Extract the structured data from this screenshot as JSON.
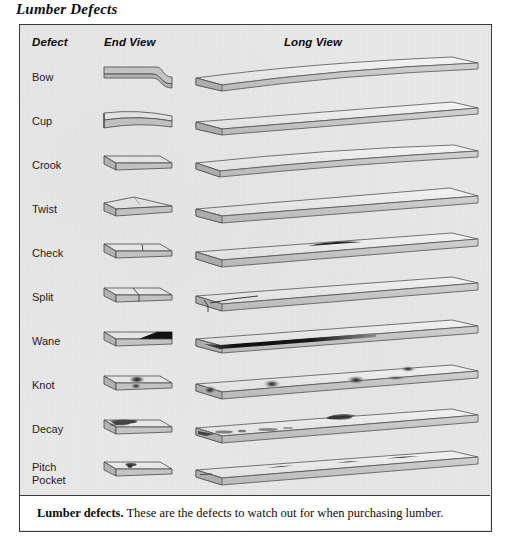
{
  "figure": {
    "title": "Lumber Defects",
    "caption_lead": "Lumber defects.",
    "caption_body": " These are the defects to watch out for when purchasing lumber."
  },
  "table": {
    "headers": {
      "defect": "Defect",
      "end_view": "End View",
      "long_view": "Long View"
    },
    "rows": [
      {
        "name": "Bow",
        "end_view_desc": "board end curving downward at one edge",
        "long_view_desc": "board bowed along its length, curving up at the far end"
      },
      {
        "name": "Cup",
        "end_view_desc": "board end with concave cupped face",
        "long_view_desc": "straight board with slightly cupped face"
      },
      {
        "name": "Crook",
        "end_view_desc": "flat straight board end",
        "long_view_desc": "board bent sideways edgewise along its length"
      },
      {
        "name": "Twist",
        "end_view_desc": "board end peaked and twisted",
        "long_view_desc": "board twisted, corners out of plane"
      },
      {
        "name": "Check",
        "end_view_desc": "short crack line in top face",
        "long_view_desc": "short lengthwise crack in the middle of the face"
      },
      {
        "name": "Split",
        "end_view_desc": "crack running full depth through the end",
        "long_view_desc": "crack running in from the end of the board"
      },
      {
        "name": "Wane",
        "end_view_desc": "dark bevel of bark or missing wood on edge",
        "long_view_desc": "dark wane strip along the full length of the edge"
      },
      {
        "name": "Knot",
        "end_view_desc": "dark knot mark on the end face",
        "long_view_desc": "several dark oval knots across the face"
      },
      {
        "name": "Decay",
        "end_view_desc": "mottled rotted area on the end face",
        "long_view_desc": "mottled decayed patches and a notched edge"
      },
      {
        "name": "Pitch\nPocket",
        "end_view_desc": "small dark pitch pocket in the face",
        "long_view_desc": "narrow dark pitch pocket slits along the face"
      }
    ]
  },
  "colors": {
    "panel_background": "#e9e9e9",
    "panel_border": "#3a3a3a",
    "board_top": "#f2f2f2",
    "board_side": "#c9c9c9",
    "board_end": "#bdbdbd",
    "outline": "#4a4a4a",
    "defect_dark": "#1a1a1a",
    "caption_background": "#ffffff",
    "text": "#0d0d0d"
  }
}
